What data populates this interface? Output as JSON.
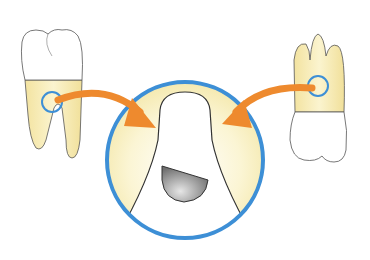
{
  "figure": {
    "caption_fragment": "",
    "left_tooth": {
      "label": "mandibular molar",
      "highlight": "furcation"
    },
    "right_tooth": {
      "label": "maxillary molar",
      "highlight": "furcation"
    },
    "magnified_view": {
      "label": "furcation detail"
    }
  },
  "colors": {
    "ring_blue": "#3d8fd6",
    "arrow_orange": "#ee8a2e",
    "root_yellow": "#f7eeb5",
    "outline": "#333333",
    "defect_gray": "#9a9a9a"
  }
}
